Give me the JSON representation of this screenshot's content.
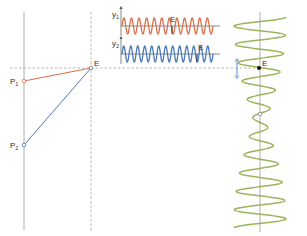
{
  "diagram": {
    "points": [
      {
        "id": "P1",
        "label": "P",
        "sub": "1",
        "x": 24,
        "y": 81
      },
      {
        "id": "P2",
        "label": "P",
        "sub": "2",
        "x": 24,
        "y": 145
      },
      {
        "id": "E",
        "label": "E",
        "x": 91,
        "y": 68
      }
    ],
    "paths": [
      {
        "from": "P1",
        "to": "E",
        "color": "#d9704a"
      },
      {
        "from": "P2",
        "to": "E",
        "color": "#4a78b8"
      }
    ],
    "axes": {
      "y1_label": "y",
      "y1_sub": "1",
      "y2_label": "y",
      "y2_sub": "2",
      "marker_label": "E"
    },
    "waves": {
      "y1": {
        "color": "#d9704a",
        "cycles": 12,
        "marker_x": 172
      },
      "y2": {
        "color": "#4a78b8",
        "cycles": 13,
        "marker_x": 197
      },
      "sum": {
        "color": "#9ab55a",
        "label": "E"
      }
    },
    "colors": {
      "axis": "#8a8a8a",
      "dashed": "#9a9a9a",
      "arrow": "#7fa8d6",
      "point_fill": "#ffffff"
    }
  }
}
